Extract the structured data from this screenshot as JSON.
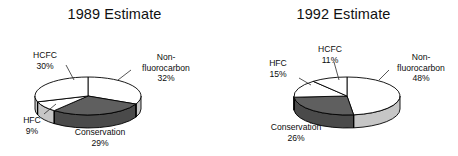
{
  "figure": {
    "background_color": "#ffffff",
    "text_color": "#0d0d0d",
    "outline_color": "#000000"
  },
  "charts": [
    {
      "id": "chart-1989",
      "title": "1989 Estimate",
      "slices": [
        {
          "label": "Non-fluorocarbon",
          "label_line1": "Non-",
          "label_line2": "fluorocarbon",
          "percent_text": "32%",
          "value": 32,
          "fill": "#ffffff"
        },
        {
          "label": "Conservation",
          "label_line1": "Conservation",
          "label_line2": "",
          "percent_text": "29%",
          "value": 29,
          "fill": "#5f5f5f"
        },
        {
          "label": "HFC",
          "label_line1": "HFC",
          "label_line2": "",
          "percent_text": "9%",
          "value": 9,
          "fill": "#ffffff"
        },
        {
          "label": "HCFC",
          "label_line1": "HCFC",
          "label_line2": "",
          "percent_text": "30%",
          "value": 30,
          "fill": "#ffffff"
        }
      ]
    },
    {
      "id": "chart-1992",
      "title": "1992 Estimate",
      "slices": [
        {
          "label": "Non-fluorocarbon",
          "label_line1": "Non-",
          "label_line2": "fluorocarbon",
          "percent_text": "48%",
          "value": 48,
          "fill": "#ffffff"
        },
        {
          "label": "Conservation",
          "label_line1": "Conservation",
          "label_line2": "",
          "percent_text": "26%",
          "value": 26,
          "fill": "#5f5f5f"
        },
        {
          "label": "HFC",
          "label_line1": "HFC",
          "label_line2": "",
          "percent_text": "15%",
          "value": 15,
          "fill": "#ffffff"
        },
        {
          "label": "HCFC",
          "label_line1": "HCFC",
          "label_line2": "",
          "percent_text": "11%",
          "value": 11,
          "fill": "#ffffff"
        }
      ]
    }
  ],
  "chart_data": [
    {
      "type": "pie",
      "title": "1989 Estimate",
      "categories": [
        "Non-fluorocarbon",
        "Conservation",
        "HFC",
        "HCFC"
      ],
      "values": [
        32,
        29,
        9,
        30
      ],
      "unit": "%",
      "data_labels": [
        "32%",
        "29%",
        "9%",
        "30%"
      ],
      "legend": "none",
      "label_position": "outside-callout",
      "three_d": true,
      "slice_colors": [
        "#ffffff",
        "#5f5f5f",
        "#ffffff",
        "#ffffff"
      ]
    },
    {
      "type": "pie",
      "title": "1992 Estimate",
      "categories": [
        "Non-fluorocarbon",
        "Conservation",
        "HFC",
        "HCFC"
      ],
      "values": [
        48,
        26,
        15,
        11
      ],
      "unit": "%",
      "data_labels": [
        "48%",
        "26%",
        "15%",
        "11%"
      ],
      "legend": "none",
      "label_position": "outside-callout",
      "three_d": true,
      "slice_colors": [
        "#ffffff",
        "#5f5f5f",
        "#ffffff",
        "#ffffff"
      ]
    }
  ]
}
